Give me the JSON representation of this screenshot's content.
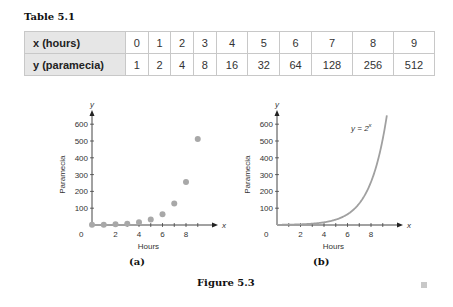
{
  "table": {
    "title": "Table 5.1",
    "rows": [
      {
        "label": "x (hours)",
        "values": [
          "0",
          "1",
          "2",
          "3",
          "4",
          "5",
          "6",
          "7",
          "8",
          "9"
        ]
      },
      {
        "label": "y (paramecia)",
        "values": [
          "1",
          "2",
          "4",
          "8",
          "16",
          "32",
          "64",
          "128",
          "256",
          "512"
        ]
      }
    ]
  },
  "figure": {
    "title": "Figure 5.3",
    "panels": [
      {
        "caption": "(a)",
        "xlabel": "Hours",
        "ylabel": "Paramecia",
        "x_axis_letter": "x",
        "y_axis_letter": "y"
      },
      {
        "caption": "(b)",
        "xlabel": "Hours",
        "ylabel": "Paramecia",
        "x_axis_letter": "x",
        "y_axis_letter": "y",
        "curve_label": "y = 2^x"
      }
    ]
  },
  "colors": {
    "point": "#a8a8a8",
    "curve": "#a0a0a0",
    "axis": "#444444",
    "table_header": "#e6e6e6"
  },
  "chart_data": [
    {
      "type": "scatter",
      "title": "(a)",
      "xlabel": "Hours",
      "ylabel": "Paramecia",
      "x": [
        0,
        1,
        2,
        3,
        4,
        5,
        6,
        7,
        8,
        9
      ],
      "y": [
        1,
        2,
        4,
        8,
        16,
        32,
        64,
        128,
        256,
        512
      ],
      "xticks": [
        "0",
        "2",
        "4",
        "6",
        "8"
      ],
      "yticks": [
        "100",
        "200",
        "300",
        "400",
        "500",
        "600"
      ],
      "xlim": [
        0,
        9.5
      ],
      "ylim": [
        0,
        650
      ],
      "grid": false
    },
    {
      "type": "line",
      "title": "(b)",
      "xlabel": "Hours",
      "ylabel": "Paramecia",
      "function": "y = 2^x",
      "annotation": "y = 2^x",
      "x": [
        0,
        1,
        2,
        3,
        4,
        5,
        6,
        7,
        8,
        9,
        9.35
      ],
      "y": [
        1,
        2,
        4,
        8,
        16,
        32,
        64,
        128,
        256,
        512,
        652
      ],
      "xticks": [
        "0",
        "2",
        "4",
        "6",
        "8"
      ],
      "yticks": [
        "100",
        "200",
        "300",
        "400",
        "500",
        "600"
      ],
      "xlim": [
        0,
        9.5
      ],
      "ylim": [
        0,
        650
      ],
      "grid": false
    }
  ]
}
